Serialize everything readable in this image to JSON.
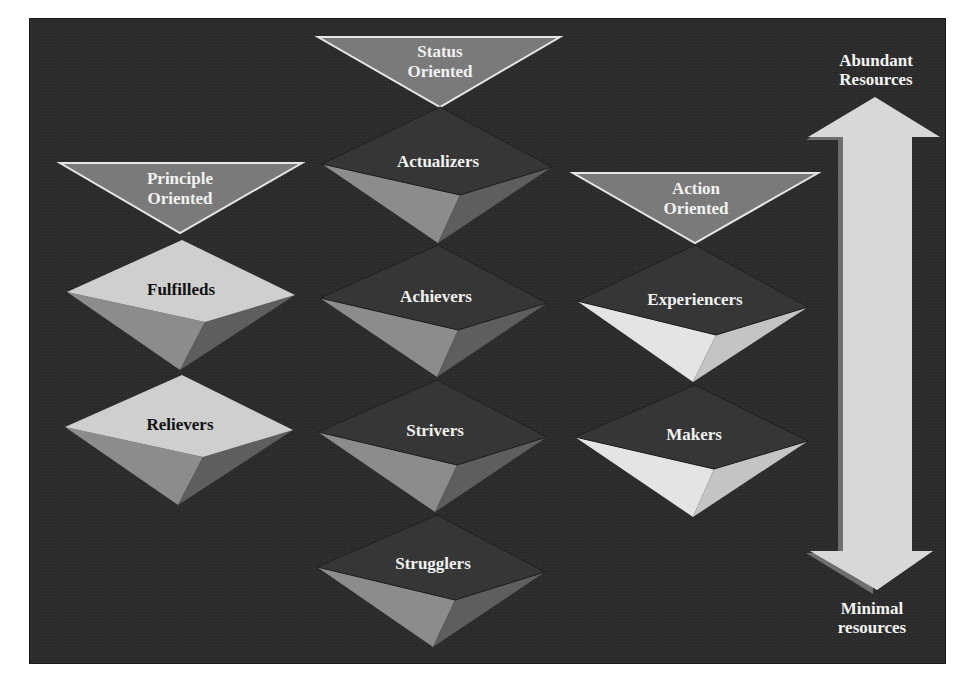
{
  "colors": {
    "background": "#2b2b2b",
    "header_triangle_fill": "#7a7a7a",
    "header_triangle_stroke": "#e6e6e6",
    "diamond_dark_top": "#363636",
    "diamond_light_top": "#cfcfcf",
    "diamond_mid_face": "#8c8c8c",
    "diamond_dark_face": "#5e5e5e",
    "arrow_fill": "#d8d8d8",
    "arrow_shadow": "#6e6e6e"
  },
  "headers": [
    {
      "id": "principle",
      "line1": "Principle",
      "line2": "Oriented"
    },
    {
      "id": "status",
      "line1": "Status",
      "line2": "Oriented"
    },
    {
      "id": "action",
      "line1": "Action",
      "line2": "Oriented"
    }
  ],
  "segments": {
    "principle": [
      {
        "label": "Fulfilleds"
      },
      {
        "label": "Relievers"
      }
    ],
    "status": [
      {
        "label": "Actualizers"
      },
      {
        "label": "Achievers"
      },
      {
        "label": "Strivers"
      },
      {
        "label": "Strugglers"
      }
    ],
    "action": [
      {
        "label": "Experiencers"
      },
      {
        "label": "Makers"
      }
    ]
  },
  "resource_axis": {
    "top_line1": "Abundant",
    "top_line2": "Resources",
    "bottom_line1": "Minimal",
    "bottom_line2": "resources",
    "arrow": "double-headed-vertical"
  }
}
